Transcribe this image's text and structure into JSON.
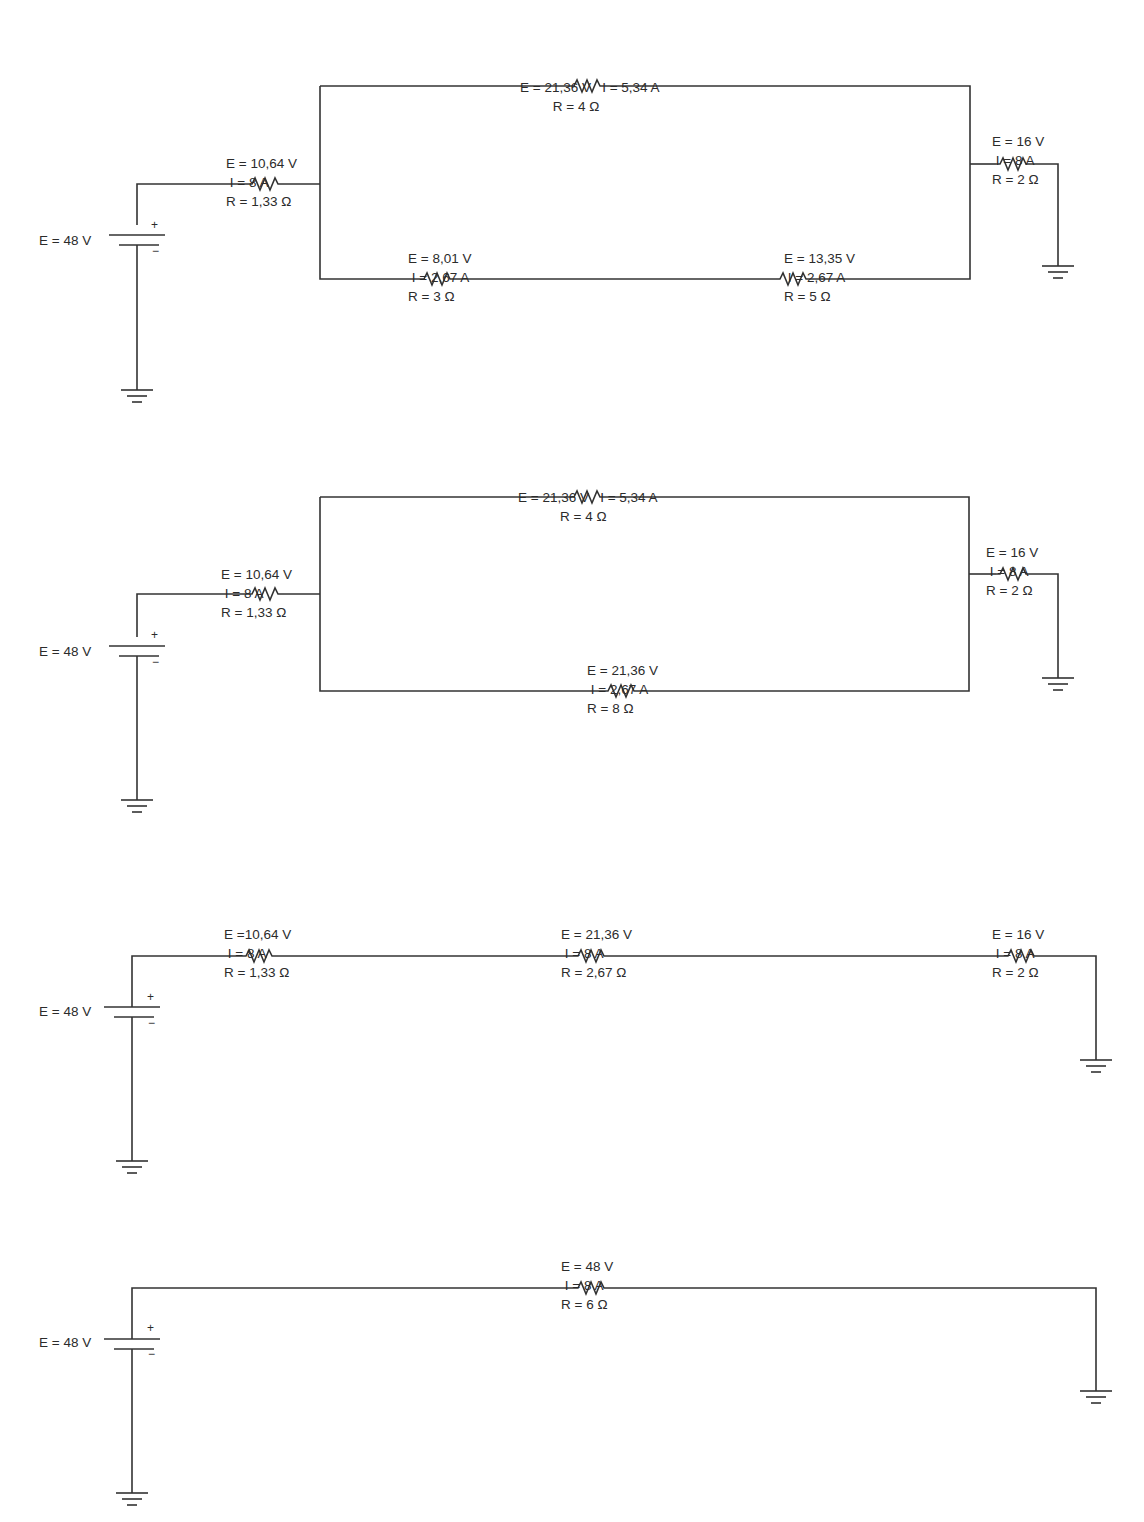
{
  "diagram": {
    "wire_color": "#333333",
    "circuits": [
      {
        "id": "step-1",
        "source": {
          "label": "E = 48 V",
          "plus": "+",
          "minus": "−"
        },
        "resistors": [
          {
            "id": "r1",
            "lines": [
              "E = 10,64 V",
              " I = 8 A",
              "R = 1,33 Ω"
            ]
          },
          {
            "id": "r2",
            "lines": [
              "E = 21,36 V   I = 5,34 A",
              "R = 4 Ω"
            ]
          },
          {
            "id": "r3",
            "lines": [
              "E = 8,01 V",
              " I = 2,67 A",
              "R = 3 Ω"
            ]
          },
          {
            "id": "r4",
            "lines": [
              "E = 13,35 V",
              " I = 2,67 A",
              "R = 5 Ω"
            ]
          },
          {
            "id": "r5",
            "lines": [
              "E = 16 V",
              " I = 8 A",
              "R = 2 Ω"
            ]
          }
        ]
      },
      {
        "id": "step-2",
        "source": {
          "label": "E = 48 V",
          "plus": "+",
          "minus": "−"
        },
        "resistors": [
          {
            "id": "r1",
            "lines": [
              "E = 10,64 V",
              " I = 8 A",
              "R = 1,33 Ω"
            ]
          },
          {
            "id": "r2",
            "lines": [
              "E = 21,36 V   I = 5,34 A",
              "R = 4 Ω"
            ]
          },
          {
            "id": "r34",
            "lines": [
              "E = 21,36 V",
              " I = 2,67 A",
              "R = 8 Ω"
            ]
          },
          {
            "id": "r5",
            "lines": [
              "E = 16 V",
              " I = 8 A",
              "R = 2 Ω"
            ]
          }
        ]
      },
      {
        "id": "step-3",
        "source": {
          "label": "E = 48 V",
          "plus": "+",
          "minus": "−"
        },
        "resistors": [
          {
            "id": "r1",
            "lines": [
              "E =10,64 V",
              " I = 8 A",
              "R = 1,33 Ω"
            ]
          },
          {
            "id": "r234",
            "lines": [
              "E = 21,36 V",
              " I = 8 A",
              "R = 2,67 Ω"
            ]
          },
          {
            "id": "r5",
            "lines": [
              "E = 16 V",
              " I = 8 A",
              "R = 2 Ω"
            ]
          }
        ]
      },
      {
        "id": "step-4",
        "source": {
          "label": "E = 48 V",
          "plus": "+",
          "minus": "−"
        },
        "resistors": [
          {
            "id": "rtotal",
            "lines": [
              "E = 48 V",
              " I = 8 A",
              "R = 6 Ω"
            ]
          }
        ]
      }
    ]
  }
}
